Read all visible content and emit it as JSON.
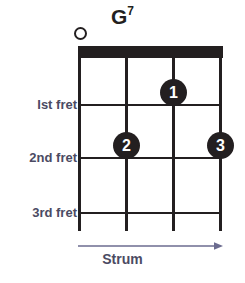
{
  "diagram": {
    "instrument": "ukulele",
    "title": {
      "root": "G",
      "quality": "7",
      "full": "G7"
    },
    "colors": {
      "ink": "#231f20",
      "label": "#4b4b63",
      "arrow": "#6b6b8f",
      "background": "#ffffff"
    },
    "strings": {
      "count": 4,
      "positions_px": [
        80,
        127,
        174,
        221
      ]
    },
    "frets": {
      "count": 3,
      "positions_px": [
        105,
        158,
        213
      ],
      "labels": [
        "Ist fret",
        "2nd fret",
        "3rd fret"
      ]
    },
    "nut": {
      "label": "nut",
      "x_px": 78,
      "y_px": 46,
      "width_px": 145,
      "height_px": 12
    },
    "open_strings": [
      {
        "string": 1,
        "marker": "open-circle",
        "x_px": 80,
        "y_px": 33
      }
    ],
    "fingerings": [
      {
        "finger": "1",
        "string": 3,
        "fret": 1,
        "x_px": 174,
        "y_px": 92
      },
      {
        "finger": "2",
        "string": 2,
        "fret": 2,
        "x_px": 127,
        "y_px": 145
      },
      {
        "finger": "3",
        "string": 4,
        "fret": 2,
        "x_px": 221,
        "y_px": 145
      }
    ],
    "strum": {
      "label": "Strum",
      "direction": "right",
      "arrow_icon": "arrow-right-icon"
    }
  }
}
